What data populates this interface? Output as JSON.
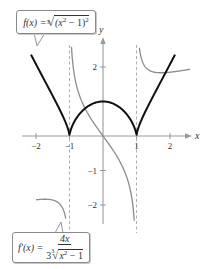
{
  "chart_data": {
    "type": "line",
    "title": "",
    "xlabel": "x",
    "ylabel": "y",
    "xlim": [
      -2.6,
      2.7
    ],
    "ylim": [
      -2.6,
      2.8
    ],
    "grid": false,
    "x_ticks": [
      -2,
      -1,
      1,
      2
    ],
    "x_tick_labels": [
      "−2",
      "−1",
      "1",
      "2"
    ],
    "y_ticks": [
      2,
      -1,
      -2
    ],
    "y_tick_labels": [
      "2",
      "−1",
      "−2"
    ],
    "asymptotes": [
      {
        "x": -1,
        "style": "dashed"
      },
      {
        "x": 1,
        "style": "dashed"
      }
    ],
    "series": [
      {
        "name": "f(x) = ∛((x² − 1)²)",
        "color": "#111111",
        "width": 2,
        "x": [
          -2.15,
          -2,
          -1.5,
          -1.2,
          -1,
          -0.8,
          -0.5,
          0,
          0.5,
          0.8,
          1,
          1.2,
          1.5,
          2,
          2.15
        ],
        "y": [
          2.33,
          2.08,
          1.16,
          0.61,
          0,
          0.56,
          0.83,
          1,
          0.83,
          0.56,
          0,
          0.61,
          1.16,
          2.08,
          2.33
        ]
      },
      {
        "name": "f′(x) = 4x / (3∛(x² − 1))",
        "color": "#8c8c8c",
        "width": 1.3,
        "x": [
          -2,
          -1.5,
          -1.1,
          -0.9,
          -0.5,
          0,
          0.5,
          0.9,
          1.1,
          1.5,
          2,
          2.6
        ],
        "y": [
          -1.85,
          -1.86,
          -2.47,
          2.07,
          0.73,
          0,
          -0.73,
          -2.07,
          2.47,
          1.86,
          1.85,
          1.94
        ]
      }
    ],
    "annotations": [
      {
        "text": "f(x) = ∛((x² − 1)²)",
        "position": "top-left",
        "points_to": "f curve"
      },
      {
        "text": "f′(x) = 4x / 3∛(x² − 1)",
        "position": "bottom-left",
        "points_to": "f′ curve"
      }
    ]
  },
  "labels": {
    "f_lhs": "f(x) = ",
    "f_root_index": "3",
    "f_radicand": "(x",
    "f_sq": "2",
    "f_mid": " − 1)",
    "f_sq2": "2",
    "fp_lhs": "f′(x) = ",
    "fp_num": "4x",
    "fp_coef": "3",
    "fp_root_index": "3",
    "fp_rad_x": "x",
    "fp_rad_sq": "2",
    "fp_rad_tail": " − 1",
    "x_axis": "x",
    "y_axis": "y"
  },
  "style": {
    "f_color": "#111111",
    "fp_color": "#8c8c8c",
    "axis_color": "#9a9a9a",
    "asymptote_color": "#9a9a9a"
  }
}
